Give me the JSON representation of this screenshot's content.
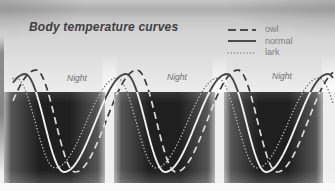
{
  "figure": {
    "title": "Body temperature curves",
    "night_labels": [
      "Night",
      "Night",
      "Night"
    ]
  },
  "legend": {
    "items": [
      {
        "label": "owl",
        "line_style": "dashed"
      },
      {
        "label": "normal",
        "line_style": "solid"
      },
      {
        "label": "lark",
        "line_style": "dotted"
      }
    ]
  },
  "palette": {
    "page_light": "#ececec",
    "page_top_gray": "#c6c6c6",
    "night_band_dark": "#1f1f1f",
    "day_gap_light": "#f2f2f2",
    "curve_on_light": "#3f3f3f",
    "curve_on_dark": "#e9e9e9",
    "legend_text_gray": "#7d7d7d",
    "title_color": "#3f3f3f",
    "night_label_gray": "#6f6f6f"
  },
  "chart_data": {
    "type": "line",
    "title": "Body temperature curves",
    "cycles_shown": 3,
    "legend_position": "top-right",
    "series": [
      {
        "name": "lark",
        "line_style": "dotted",
        "phase": "earliest minimum in the night"
      },
      {
        "name": "normal",
        "line_style": "solid",
        "phase": "intermediate minimum"
      },
      {
        "name": "owl",
        "line_style": "dashed",
        "phase": "latest minimum in the night"
      }
    ],
    "night_bands_px": [
      [
        4,
        105
      ],
      [
        114,
        215
      ],
      [
        224,
        323
      ]
    ],
    "band_y_px": [
      92,
      183
    ],
    "geometry_px": {
      "x_range": [
        13,
        333
      ],
      "period": 101,
      "rise_px": 62,
      "fall_px": 39,
      "series": {
        "lark": {
          "first_min_x": 55,
          "y_min": 168,
          "y_peak": 78
        },
        "normal": {
          "first_min_x": 64,
          "y_min": 172,
          "y_peak": 74
        },
        "owl": {
          "first_min_x": 75,
          "y_min": 172,
          "y_peak": 70
        }
      }
    }
  }
}
